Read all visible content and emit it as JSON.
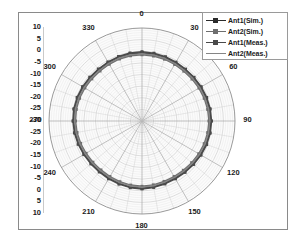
{
  "chart_data": {
    "type": "line",
    "subtype": "polar",
    "title": "",
    "xlabel": "",
    "ylabel": "",
    "grid": true,
    "legend_position": "top-right",
    "angular_axis": {
      "unit": "degrees",
      "tick_labels": [
        "0",
        "30",
        "60",
        "90",
        "120",
        "150",
        "180",
        "210",
        "240",
        "270",
        "300",
        "330"
      ],
      "tick_values": [
        0,
        30,
        60,
        90,
        120,
        150,
        180,
        210,
        240,
        270,
        300,
        330
      ],
      "minor_step": 10,
      "major_step": 30,
      "direction": "clockwise",
      "zero_at": "top"
    },
    "radial_axis": {
      "unit": "dB",
      "rlim": [
        -30,
        10
      ],
      "ring_step": 5,
      "center_value": -30,
      "outer_value": 10,
      "tick_labels_top": [
        "10",
        "5",
        "0",
        "-5",
        "-10",
        "-15",
        "-20",
        "-25",
        "-30"
      ],
      "tick_labels_bottom": [
        "-30",
        "-25",
        "-20",
        "-15",
        "-10",
        "-5",
        "0",
        "5",
        "10"
      ],
      "minor_step": 1
    },
    "series": [
      {
        "name": "Ant1(Sim.)",
        "color": "#2b2b2b",
        "marker": "square",
        "angles": [
          0,
          10,
          20,
          30,
          40,
          50,
          60,
          70,
          80,
          90,
          100,
          110,
          120,
          130,
          140,
          150,
          160,
          170,
          180,
          190,
          200,
          210,
          220,
          230,
          240,
          250,
          260,
          270,
          280,
          290,
          300,
          310,
          320,
          330,
          340,
          350
        ],
        "values": [
          -0.6,
          -0.8,
          -0.9,
          -1.1,
          -1.2,
          -1.1,
          -0.9,
          -0.7,
          -0.5,
          -0.4,
          -0.5,
          -0.7,
          -1.0,
          -1.3,
          -1.5,
          -1.6,
          -1.5,
          -1.3,
          -1.1,
          -1.2,
          -1.4,
          -1.6,
          -1.7,
          -1.6,
          -1.4,
          -1.1,
          -0.8,
          -0.6,
          -0.5,
          -0.6,
          -0.8,
          -1.0,
          -1.1,
          -1.0,
          -0.8,
          -0.7
        ]
      },
      {
        "name": "Ant2(Sim.)",
        "color": "#6e6e6e",
        "marker": "square",
        "angles": [
          0,
          10,
          20,
          30,
          40,
          50,
          60,
          70,
          80,
          90,
          100,
          110,
          120,
          130,
          140,
          150,
          160,
          170,
          180,
          190,
          200,
          210,
          220,
          230,
          240,
          250,
          260,
          270,
          280,
          290,
          300,
          310,
          320,
          330,
          340,
          350
        ],
        "values": [
          -1.5,
          -1.6,
          -1.7,
          -1.9,
          -2.0,
          -1.9,
          -1.7,
          -1.5,
          -1.3,
          -1.2,
          -1.3,
          -1.5,
          -1.8,
          -2.1,
          -2.3,
          -2.4,
          -2.3,
          -2.1,
          -1.9,
          -2.0,
          -2.2,
          -2.4,
          -2.5,
          -2.4,
          -2.2,
          -1.9,
          -1.6,
          -1.4,
          -1.3,
          -1.4,
          -1.6,
          -1.8,
          -1.9,
          -1.8,
          -1.6,
          -1.5
        ]
      },
      {
        "name": "Ant1(Meas.)",
        "color": "#4a4a4a",
        "marker": "square",
        "angles": [
          0,
          10,
          20,
          30,
          40,
          50,
          60,
          70,
          80,
          90,
          100,
          110,
          120,
          130,
          140,
          150,
          160,
          170,
          180,
          190,
          200,
          210,
          220,
          230,
          240,
          250,
          260,
          270,
          280,
          290,
          300,
          310,
          320,
          330,
          340,
          350
        ],
        "values": [
          -0.2,
          -0.4,
          -0.6,
          -0.8,
          -0.9,
          -0.8,
          -0.6,
          -0.4,
          -0.2,
          -0.1,
          -0.2,
          -0.4,
          -0.7,
          -1.0,
          -1.2,
          -1.3,
          -1.2,
          -1.0,
          -0.8,
          -0.9,
          -1.1,
          -1.3,
          -1.4,
          -1.3,
          -1.1,
          -0.8,
          -0.5,
          -0.3,
          -0.2,
          -0.3,
          -0.5,
          -0.7,
          -0.8,
          -0.7,
          -0.5,
          -0.3
        ]
      },
      {
        "name": "Ant2(Meas.)",
        "color": "#858585",
        "marker": "none",
        "angles": [
          0,
          10,
          20,
          30,
          40,
          50,
          60,
          70,
          80,
          90,
          100,
          110,
          120,
          130,
          140,
          150,
          160,
          170,
          180,
          190,
          200,
          210,
          220,
          230,
          240,
          250,
          260,
          270,
          280,
          290,
          300,
          310,
          320,
          330,
          340,
          350
        ],
        "values": [
          -1.1,
          -1.2,
          -1.3,
          -1.5,
          -1.6,
          -1.5,
          -1.3,
          -1.1,
          -0.9,
          -0.8,
          -0.9,
          -1.1,
          -1.4,
          -1.7,
          -1.9,
          -2.0,
          -1.9,
          -1.7,
          -1.5,
          -1.6,
          -1.8,
          -2.0,
          -2.1,
          -2.0,
          -1.8,
          -1.5,
          -1.2,
          -1.0,
          -0.9,
          -1.0,
          -1.2,
          -1.4,
          -1.5,
          -1.4,
          -1.2,
          -1.1
        ]
      }
    ]
  },
  "legend": {
    "entries": [
      {
        "label": "Ant1(Sim.)"
      },
      {
        "label": "Ant2(Sim.)"
      },
      {
        "label": "Ant1(Meas.)"
      },
      {
        "label": "Ant2(Meas.)"
      }
    ]
  },
  "colors": {
    "frame": "#8a8a8a",
    "grid_minor": "#c9c9c9",
    "grid_major": "#a6a6a6",
    "text": "#1a1a1a",
    "background": "#ffffff"
  }
}
